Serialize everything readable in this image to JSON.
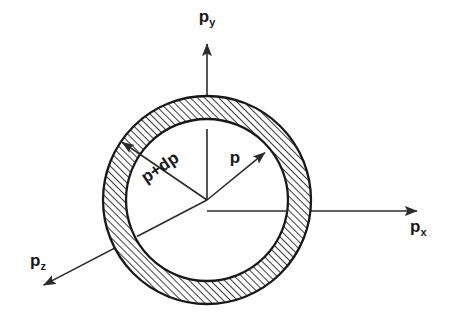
{
  "figure": {
    "kind": "diagram",
    "background_color": "#ffffff",
    "line_color": "#2b2b2b",
    "hatch_color": "#333333"
  },
  "axes": [
    {
      "id": "py",
      "base": "p",
      "subscript": "y",
      "label": "py",
      "direction": "up",
      "arrow_tip": {
        "x": 207,
        "y": 40
      },
      "label_pos": {
        "x": 207,
        "y": 22
      }
    },
    {
      "id": "px",
      "base": "p",
      "subscript": "x",
      "label": "px",
      "direction": "right",
      "arrow_tip": {
        "x": 421,
        "y": 211
      },
      "label_pos": {
        "x": 419,
        "y": 231
      }
    },
    {
      "id": "pz",
      "base": "p",
      "subscript": "z",
      "label": "pz",
      "direction": "down-left",
      "arrow_tip": {
        "x": 40,
        "y": 287
      },
      "label_pos": {
        "x": 40,
        "y": 263
      }
    }
  ],
  "shell": {
    "center": {
      "x": 207,
      "y": 200
    },
    "inner_radius": 81,
    "outer_radius": 104,
    "hatch_angle_deg": 45,
    "hatch_spacing_px": 5,
    "inner_fill": "#ffffff"
  },
  "radii": [
    {
      "id": "p",
      "label": "p",
      "from": {
        "x": 207,
        "y": 200
      },
      "to": {
        "x": 268,
        "y": 150
      },
      "label_pos": {
        "x": 235,
        "y": 163
      },
      "label_rotation_deg": 0,
      "terminates_at": "inner-circle"
    },
    {
      "id": "p-plus-dp",
      "label": "p+dp",
      "from": {
        "x": 207,
        "y": 200
      },
      "to": {
        "x": 119,
        "y": 140
      },
      "label_pos": {
        "x": 163,
        "y": 172
      },
      "label_rotation_deg": -34,
      "terminates_at": "outer-circle"
    }
  ]
}
